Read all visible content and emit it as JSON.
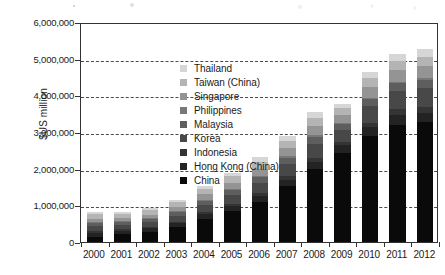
{
  "figure": {
    "ylabel": "$US million"
  },
  "chart_data": {
    "type": "bar",
    "subtype": "stacked-bar",
    "title": "",
    "xlabel": "",
    "ylabel": "$US million",
    "ylim": [
      0,
      6000000
    ],
    "ytick_labels": [
      "0",
      "1,000,000",
      "2,000,000",
      "3,000,000",
      "4,000,000",
      "5,000,000",
      "6,000,000"
    ],
    "ytick_values": [
      0,
      1000000,
      2000000,
      3000000,
      4000000,
      5000000,
      6000000
    ],
    "grid": "horizontal-dashed",
    "legend_position": "inside-upper-left",
    "categories": [
      "2000",
      "2001",
      "2002",
      "2003",
      "2004",
      "2005",
      "2006",
      "2007",
      "2008",
      "2009",
      "2010",
      "2011",
      "2012"
    ],
    "series": [
      {
        "name": "China",
        "color": "#0a0a0a",
        "values": [
          150000,
          210000,
          270000,
          400000,
          620000,
          840000,
          1100000,
          1520000,
          1980000,
          2440000,
          2890000,
          3200000,
          3270000
        ]
      },
      {
        "name": "Hong Kong (China)",
        "color": "#232323",
        "values": [
          100000,
          95000,
          100000,
          115000,
          135000,
          145000,
          160000,
          185000,
          200000,
          195000,
          235000,
          255000,
          260000
        ]
      },
      {
        "name": "Indonesia",
        "color": "#343434",
        "values": [
          42000,
          40000,
          42000,
          45000,
          55000,
          65000,
          80000,
          95000,
          115000,
          100000,
          135000,
          160000,
          165000
        ]
      },
      {
        "name": "Korea",
        "color": "#484848",
        "values": [
          135000,
          120000,
          130000,
          160000,
          205000,
          240000,
          280000,
          325000,
          390000,
          330000,
          440000,
          495000,
          505000
        ]
      },
      {
        "name": "Malaysia",
        "color": "#5e5e5e",
        "values": [
          85000,
          75000,
          80000,
          90000,
          110000,
          125000,
          145000,
          165000,
          185000,
          145000,
          190000,
          215000,
          220000
        ]
      },
      {
        "name": "Philippines",
        "color": "#787878",
        "values": [
          30000,
          28000,
          30000,
          32000,
          35000,
          38000,
          42000,
          45000,
          45000,
          35000,
          45000,
          45000,
          48000
        ]
      },
      {
        "name": "Singapore",
        "color": "#949494",
        "values": [
          95000,
          90000,
          95000,
          110000,
          140000,
          165000,
          195000,
          220000,
          260000,
          215000,
          285000,
          320000,
          325000
        ]
      },
      {
        "name": "Taiwan (China)",
        "color": "#b4b4b4",
        "values": [
          130000,
          110000,
          115000,
          130000,
          155000,
          170000,
          195000,
          210000,
          210000,
          185000,
          250000,
          260000,
          265000
        ]
      },
      {
        "name": "Thailand",
        "color": "#d6d6d6",
        "values": [
          58000,
          55000,
          60000,
          70000,
          85000,
          100000,
          115000,
          130000,
          155000,
          130000,
          175000,
          190000,
          195000
        ]
      }
    ],
    "totals": [
      825000,
      823000,
      922000,
      1152000,
      1540000,
      1888000,
      2312000,
      2895000,
      3540000,
      3775000,
      4645000,
      5140000,
      5253000
    ]
  },
  "legend": {
    "items": [
      {
        "label": "Thailand",
        "color": "#d6d6d6"
      },
      {
        "label": "Taiwan (China)",
        "color": "#b4b4b4"
      },
      {
        "label": "Singapore",
        "color": "#949494"
      },
      {
        "label": "Philippines",
        "color": "#787878"
      },
      {
        "label": "Malaysia",
        "color": "#5e5e5e"
      },
      {
        "label": "Korea",
        "color": "#484848"
      },
      {
        "label": "Indonesia",
        "color": "#343434"
      },
      {
        "label": "Hong Kong (China)",
        "color": "#232323"
      },
      {
        "label": "China",
        "color": "#0a0a0a"
      }
    ]
  }
}
